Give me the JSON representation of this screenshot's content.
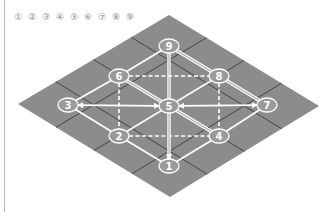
{
  "legend": {
    "items": [
      "①",
      "②",
      "③",
      "④",
      "⑤",
      "⑥",
      "⑦",
      "⑧",
      "⑨"
    ]
  },
  "board": {
    "colors": {
      "tile_fill": "#8c8c8c",
      "grid_line": "#3c3c3c",
      "path_line": "#ffffff",
      "node_fill": "#9a9a9a",
      "node_stroke": "#ffffff"
    },
    "corners": {
      "top": [
        169,
        15
      ],
      "right": [
        319,
        106
      ],
      "bottom": [
        170,
        197
      ],
      "left": [
        18,
        104
      ]
    },
    "tiles": "4x4",
    "nodes": [
      {
        "id": "1",
        "label": "1",
        "x": 169,
        "y": 166
      },
      {
        "id": "2",
        "label": "2",
        "x": 119,
        "y": 136
      },
      {
        "id": "3",
        "label": "3",
        "x": 68,
        "y": 105
      },
      {
        "id": "4",
        "label": "4",
        "x": 219,
        "y": 136
      },
      {
        "id": "5",
        "label": "5",
        "x": 169,
        "y": 106
      },
      {
        "id": "6",
        "label": "6",
        "x": 119,
        "y": 76
      },
      {
        "id": "7",
        "label": "7",
        "x": 267,
        "y": 105
      },
      {
        "id": "8",
        "label": "8",
        "x": 219,
        "y": 76
      },
      {
        "id": "9",
        "label": "9",
        "x": 169,
        "y": 46
      }
    ],
    "edges": [
      {
        "from": "9",
        "to": "6",
        "style": "solid"
      },
      {
        "from": "9",
        "to": "8",
        "style": "double"
      },
      {
        "from": "9",
        "to": "5",
        "style": "double"
      },
      {
        "from": "6",
        "to": "8",
        "style": "dashed"
      },
      {
        "from": "6",
        "to": "5",
        "style": "double"
      },
      {
        "from": "8",
        "to": "5",
        "style": "solid"
      },
      {
        "from": "6",
        "to": "2",
        "style": "dashed"
      },
      {
        "from": "8",
        "to": "4",
        "style": "dashed"
      },
      {
        "from": "3",
        "to": "6",
        "style": "solid"
      },
      {
        "from": "3",
        "to": "5",
        "style": "arrow-both"
      },
      {
        "from": "3",
        "to": "2",
        "style": "solid"
      },
      {
        "from": "2",
        "to": "5",
        "style": "solid"
      },
      {
        "from": "8",
        "to": "7",
        "style": "double"
      },
      {
        "from": "5",
        "to": "7",
        "style": "arrow-both"
      },
      {
        "from": "5",
        "to": "4",
        "style": "double"
      },
      {
        "from": "7",
        "to": "4",
        "style": "solid"
      },
      {
        "from": "2",
        "to": "4",
        "style": "dashed"
      },
      {
        "from": "2",
        "to": "1",
        "style": "solid"
      },
      {
        "from": "4",
        "to": "1",
        "style": "solid"
      },
      {
        "from": "5",
        "to": "1",
        "style": "double-arrow"
      }
    ]
  }
}
